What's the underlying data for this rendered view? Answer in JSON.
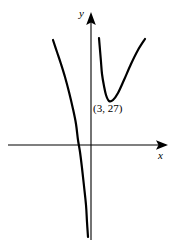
{
  "figure": {
    "title": "",
    "background_color": "#ffffff",
    "width": 176,
    "height": 248
  },
  "axes": {
    "x": {
      "label": "x",
      "arrow": true,
      "color": "#000000"
    },
    "y": {
      "label": "y",
      "arrow": true,
      "color": "#000000"
    }
  },
  "annotations": [
    {
      "name": "minimum-point-label",
      "text": "(3, 27)",
      "x_value": 3,
      "y_value": 27
    }
  ],
  "chart_data": {
    "type": "line",
    "title": "",
    "xlabel": "x",
    "ylabel": "y",
    "grid": false,
    "legend": null,
    "axis_arrows": true,
    "origin_px": {
      "x": 91,
      "y": 145
    },
    "series": [
      {
        "name": "left-branch",
        "description": "Decreasing branch left of the vertical asymptote at x = 0; falls steeply and approaches the y-axis from the left going to negative infinity.",
        "points_px": [
          [
            53,
            40
          ],
          [
            57,
            52
          ],
          [
            61,
            64
          ],
          [
            65,
            77
          ],
          [
            69,
            92
          ],
          [
            73,
            109
          ],
          [
            76,
            124
          ],
          [
            78,
            140
          ],
          [
            80,
            152
          ],
          [
            82,
            168
          ],
          [
            84,
            186
          ],
          [
            86,
            205
          ],
          [
            87,
            222
          ],
          [
            88,
            237
          ]
        ],
        "x_intercept_px": 78,
        "color": "#000000",
        "stroke_width": 2.2
      },
      {
        "name": "right-branch",
        "description": "U-shaped branch right of the vertical asymptote at x = 0 with a local minimum at (3, 27).",
        "points_px": [
          [
            99,
            38
          ],
          [
            100,
            50
          ],
          [
            101,
            62
          ],
          [
            102,
            74
          ],
          [
            104,
            86
          ],
          [
            106,
            95
          ],
          [
            109,
            101
          ],
          [
            113,
            100
          ],
          [
            118,
            93
          ],
          [
            124,
            80
          ],
          [
            131,
            64
          ],
          [
            138,
            50
          ],
          [
            145,
            39
          ]
        ],
        "minimum_px": [
          109,
          101
        ],
        "color": "#000000",
        "stroke_width": 2.2
      }
    ],
    "annotations": [
      {
        "text": "(3, 27)",
        "x": 3,
        "y": 27,
        "px": [
          93,
          103
        ]
      }
    ]
  }
}
